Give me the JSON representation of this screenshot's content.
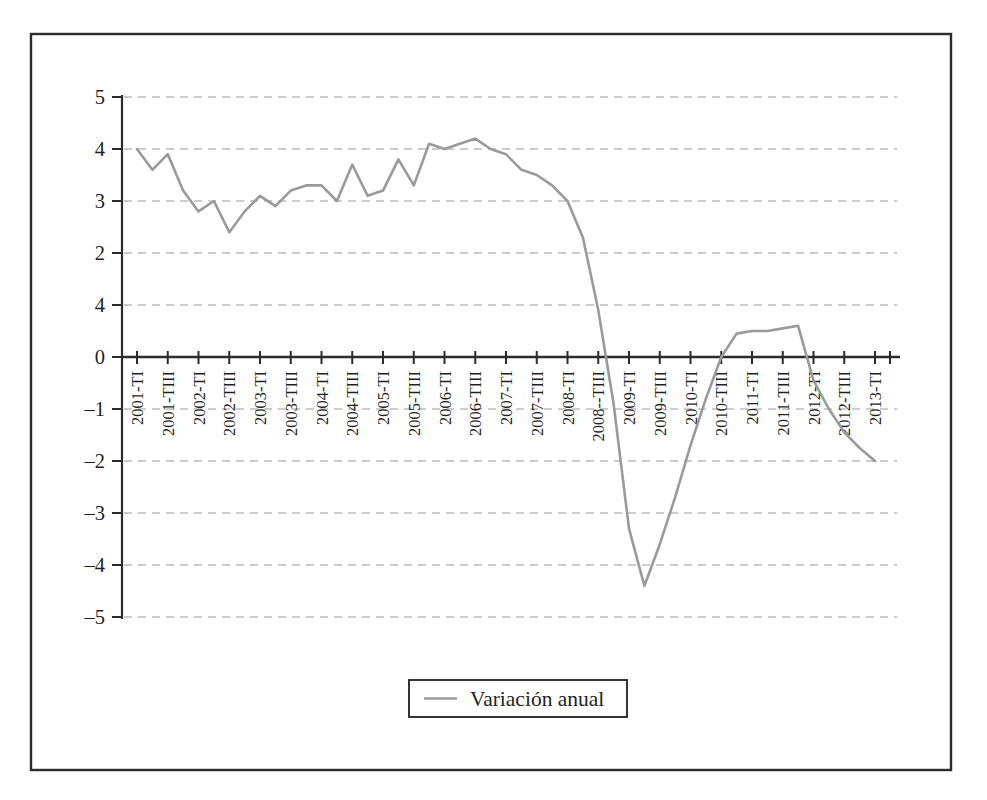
{
  "figure": {
    "legend_label": "Variación anual"
  },
  "chart_data": {
    "type": "line",
    "title": "",
    "xlabel": "",
    "ylabel": "",
    "ylim": [
      -5,
      5
    ],
    "y_step": 1,
    "grid": "horizontal-dashed",
    "legend_position": "bottom-center",
    "y_tick_values": [
      5,
      4,
      3,
      2,
      1,
      0,
      -1,
      -2,
      -3,
      -4,
      -5
    ],
    "y_tick_display_labels": [
      "5",
      "4",
      "3",
      "2",
      "4",
      "0",
      "–1",
      "–2",
      "–3",
      "–4",
      "–5"
    ],
    "x_tick_labels": [
      "2001-TI",
      "2001-TIII",
      "2002-TI",
      "2002-TIII",
      "2003-TI",
      "2003-TIII",
      "2004-TI",
      "2004-TIII",
      "2005-TI",
      "2005-TIII",
      "2006-TI",
      "2006-TIII",
      "2007-TI",
      "2007-TIII",
      "2008-TI",
      "2008--TIII",
      "2009-TI",
      "2009-TIII",
      "2010-TI",
      "2010-TIII",
      "2011-TI",
      "2011-TIII",
      "2012-TI",
      "2012-TIII",
      "2013-TI"
    ],
    "x_label_every": 2,
    "categories": [
      "2001-TI",
      "2001-TII",
      "2001-TIII",
      "2001-TIV",
      "2002-TI",
      "2002-TII",
      "2002-TIII",
      "2002-TIV",
      "2003-TI",
      "2003-TII",
      "2003-TIII",
      "2003-TIV",
      "2004-TI",
      "2004-TII",
      "2004-TIII",
      "2004-TIV",
      "2005-TI",
      "2005-TII",
      "2005-TIII",
      "2005-TIV",
      "2006-TI",
      "2006-TII",
      "2006-TIII",
      "2006-TIV",
      "2007-TI",
      "2007-TII",
      "2007-TIII",
      "2007-TIV",
      "2008-TI",
      "2008-TII",
      "2008-TIII",
      "2008-TIV",
      "2009-TI",
      "2009-TII",
      "2009-TIII",
      "2009-TIV",
      "2010-TI",
      "2010-TII",
      "2010-TIII",
      "2010-TIV",
      "2011-TI",
      "2011-TII",
      "2011-TIII",
      "2011-TIV",
      "2012-TI",
      "2012-TII",
      "2012-TIII",
      "2012-TIV",
      "2013-TI"
    ],
    "series": [
      {
        "name": "Variación anual",
        "color": "#9a9a9a",
        "values": [
          4.0,
          3.6,
          3.9,
          3.2,
          2.8,
          3.0,
          2.4,
          2.8,
          3.1,
          2.9,
          3.2,
          3.3,
          3.3,
          3.0,
          3.7,
          3.1,
          3.2,
          3.8,
          3.3,
          4.1,
          4.0,
          4.1,
          4.2,
          4.0,
          3.9,
          3.6,
          3.5,
          3.3,
          3.0,
          2.3,
          0.9,
          -0.9,
          -3.3,
          -4.4,
          -3.6,
          -2.7,
          -1.7,
          -0.8,
          0.0,
          0.45,
          0.5,
          0.5,
          0.55,
          0.6,
          -0.45,
          -1.0,
          -1.45,
          -1.75,
          -2.0
        ]
      }
    ],
    "colors": {
      "line": "#9a9a9a",
      "axis": "#2b2b2b",
      "gridline": "#bcbcbc",
      "frame_border": "#2b2b2b",
      "background": "#ffffff"
    }
  }
}
